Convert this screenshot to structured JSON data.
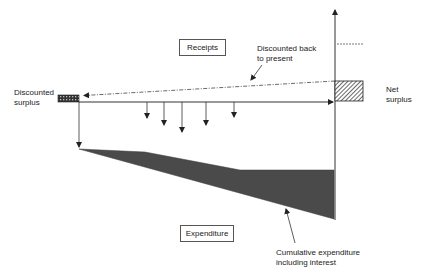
{
  "diagram": {
    "labels": {
      "receipts": "Receipts",
      "expenditure": "Expenditure",
      "discounted_back": "Discounted back\nto present",
      "discounted_surplus": "Discounted\nsurplus",
      "net_surplus": "Net\nsurplus",
      "cumulative_expenditure": "Cumulative expenditure\nincluding interest"
    },
    "colors": {
      "line": "#333333",
      "fill": "#4a4a4a",
      "hatch": "#555555"
    },
    "receipt_arrows_x": [
      147,
      164,
      182,
      206,
      234
    ],
    "receipt_arrows_len": [
      13,
      20,
      27,
      20,
      12
    ]
  }
}
